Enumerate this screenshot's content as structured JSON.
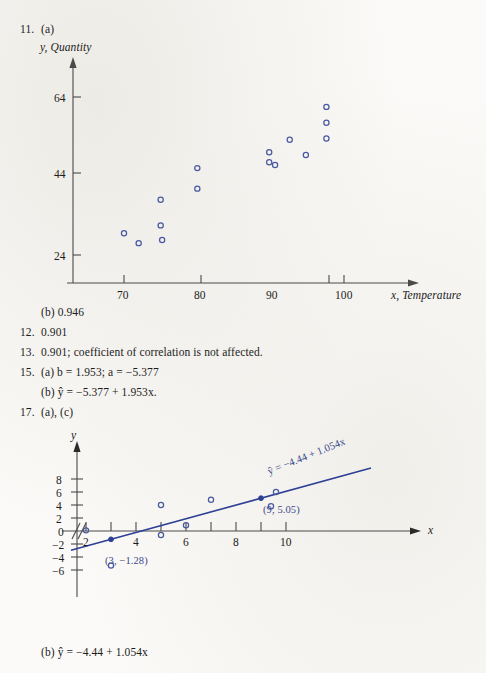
{
  "page": {
    "background": "#fbfaf8",
    "ink": "#1c1c1c",
    "accent": "#2e3f96",
    "marker_stroke": "#4a5aa0"
  },
  "items": [
    {
      "id": "item-11",
      "number": "11.",
      "label": "(a)"
    },
    {
      "id": "item-11b",
      "number": "",
      "label": "(b) 0.946"
    },
    {
      "id": "item-12",
      "number": "12.",
      "label": "0.901"
    },
    {
      "id": "item-13",
      "number": "13.",
      "label": "0.901; coefficient of correlation is not affected."
    },
    {
      "id": "item-15a",
      "number": "15.",
      "label": "(a) b  =  1.953; a  =  −5.377"
    },
    {
      "id": "item-15b",
      "number": "",
      "label": "(b) ŷ  =  −5.377  +  1.953x."
    },
    {
      "id": "item-17",
      "number": "17.",
      "label": "(a), (c)"
    },
    {
      "id": "item-17b",
      "number": "",
      "label": "(b) ŷ  =  −4.44  +  1.054x"
    }
  ],
  "text_lines": {
    "line_11_number": "11.",
    "line_11_label": "(a)",
    "line_11b": "(b) 0.946",
    "line_12_number": "12.",
    "line_12_value": "0.901",
    "line_13_number": "13.",
    "line_13_value": "0.901; coefficient of correlation is not affected.",
    "line_15_number": "15.",
    "line_15a": "(a) b  =  1.953; a  =  −5.377",
    "line_15b": "(b) ŷ  =  −5.377  +  1.953x.",
    "line_17_number": "17.",
    "line_17_label": "(a), (c)",
    "line_17b": "(b) ŷ  =  −4.44  +  1.054x"
  },
  "chart_data": [
    {
      "id": "chart-scatter-temperature",
      "type": "scatter",
      "title": "",
      "xlabel": "x, Temperature",
      "ylabel": "y, Quantity",
      "x_ticks": [
        70,
        80,
        90,
        100
      ],
      "y_ticks": [
        24,
        44,
        64
      ],
      "xlim": [
        66,
        104
      ],
      "ylim": [
        18,
        70
      ],
      "grid": false,
      "legend": "none",
      "points": [
        {
          "x": 70.0,
          "y": 29.5
        },
        {
          "x": 72.0,
          "y": 27.0
        },
        {
          "x": 75.0,
          "y": 38.0
        },
        {
          "x": 75.0,
          "y": 31.5
        },
        {
          "x": 75.2,
          "y": 27.8
        },
        {
          "x": 80.0,
          "y": 46.0
        },
        {
          "x": 80.0,
          "y": 40.8
        },
        {
          "x": 89.8,
          "y": 50.0
        },
        {
          "x": 89.8,
          "y": 47.5
        },
        {
          "x": 90.6,
          "y": 46.8
        },
        {
          "x": 92.6,
          "y": 53.2
        },
        {
          "x": 94.8,
          "y": 49.3
        },
        {
          "x": 97.6,
          "y": 61.5
        },
        {
          "x": 97.6,
          "y": 57.5
        },
        {
          "x": 97.6,
          "y": 53.5
        }
      ]
    },
    {
      "id": "chart-regression-line",
      "type": "scatter",
      "title": "",
      "xlabel": "x",
      "ylabel": "y",
      "x_ticks": [
        2,
        3,
        4,
        5,
        6,
        7,
        8,
        9,
        10,
        11
      ],
      "x_tick_labels": [
        "2",
        "",
        "4",
        "",
        "6",
        "",
        "8",
        "",
        "10",
        ""
      ],
      "y_ticks": [
        -6,
        -4,
        -2,
        0,
        2,
        4,
        6,
        8
      ],
      "y_tick_labels": [
        "−6",
        "−4",
        "−2",
        "0",
        "2",
        "4",
        "6",
        "8"
      ],
      "xlim": [
        1.2,
        14.0
      ],
      "ylim": [
        -7.5,
        9.5
      ],
      "grid": false,
      "legend": "none",
      "axis_break": true,
      "points": [
        {
          "x": 2.0,
          "y": 0.1
        },
        {
          "x": 3.0,
          "y": -5.3
        },
        {
          "x": 5.0,
          "y": 4.0
        },
        {
          "x": 5.0,
          "y": -0.6
        },
        {
          "x": 6.0,
          "y": 0.9
        },
        {
          "x": 7.0,
          "y": 4.8
        },
        {
          "x": 9.4,
          "y": 3.8
        },
        {
          "x": 9.6,
          "y": 6.0
        }
      ],
      "highlight_points": [
        {
          "x": 3.0,
          "y": -1.28,
          "label": "(3, −1.28)"
        },
        {
          "x": 9.0,
          "y": 5.05,
          "label": "(9, 5.05)"
        }
      ],
      "fit": {
        "intercept": -4.44,
        "slope": 1.054,
        "equation_label": "ŷ  =  −4.44  +  1.054x",
        "x_start": 1.4,
        "x_end": 13.4
      }
    }
  ]
}
